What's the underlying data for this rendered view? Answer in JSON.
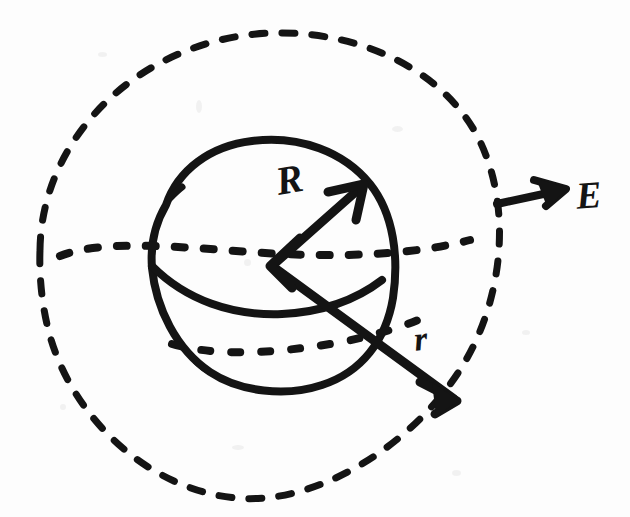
{
  "figure": {
    "kind": "hand-drawn-physics-diagram",
    "background_color": "#fdfdfd",
    "ink_color": "#141414"
  },
  "labels": {
    "radius_sphere": "R",
    "radius_gaussian": "r",
    "field": "E"
  },
  "shapes": {
    "gaussian_surface": {
      "name": "outer-dashed-circle",
      "center_x": 270,
      "center_y": 266,
      "radius": 232,
      "style": "dashed"
    },
    "charged_sphere": {
      "name": "inner-solid-sphere",
      "center_x": 273,
      "center_y": 265,
      "radius": 122,
      "style": "solid"
    },
    "equator_back": {
      "name": "upper-dotted-ellipse",
      "center_y": 250,
      "style": "dotted"
    },
    "equator_front": {
      "name": "solid-equator-curve",
      "style": "solid"
    },
    "lower_latitude": {
      "name": "lower-dotted-ellipse",
      "center_y": 341,
      "style": "dotted"
    }
  },
  "arrows": {
    "R": {
      "from_x": 272,
      "from_y": 266,
      "to_x": 362,
      "to_y": 186
    },
    "r": {
      "from_x": 272,
      "from_y": 266,
      "to_x": 456,
      "to_y": 400
    },
    "E": {
      "from_x": 497,
      "from_y": 203,
      "to_x": 560,
      "to_y": 188
    }
  }
}
